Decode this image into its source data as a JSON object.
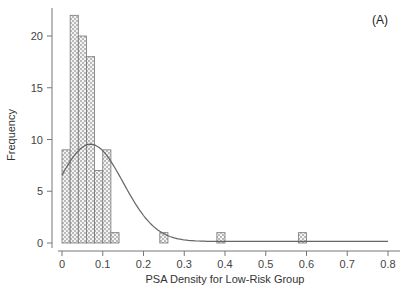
{
  "chart_data": {
    "type": "bar",
    "subtype": "histogram_with_normal_curve",
    "panel_label": "(A)",
    "title": "",
    "xlabel": "PSA Density for Low-Risk Group",
    "ylabel": "Frequency",
    "xlim": [
      0,
      0.8
    ],
    "ylim": [
      0,
      22
    ],
    "xticks": [
      0,
      0.1,
      0.2,
      0.3,
      0.4,
      0.5,
      0.6,
      0.7,
      0.8
    ],
    "xtick_labels": [
      "0",
      "0.1",
      "0.2",
      "0.3",
      "0.4",
      "0.5",
      "0.6",
      "0.7",
      "0.8"
    ],
    "yticks": [
      0,
      5,
      10,
      15,
      20
    ],
    "ytick_labels": [
      "0",
      "5",
      "10",
      "15",
      "20"
    ],
    "grid": false,
    "legend": null,
    "bin_width": 0.02,
    "bins": [
      {
        "start": 0.0,
        "end": 0.02,
        "count": 9
      },
      {
        "start": 0.02,
        "end": 0.04,
        "count": 22
      },
      {
        "start": 0.04,
        "end": 0.06,
        "count": 20
      },
      {
        "start": 0.06,
        "end": 0.08,
        "count": 18
      },
      {
        "start": 0.08,
        "end": 0.1,
        "count": 7
      },
      {
        "start": 0.1,
        "end": 0.12,
        "count": 9
      },
      {
        "start": 0.12,
        "end": 0.14,
        "count": 1
      },
      {
        "start": 0.24,
        "end": 0.26,
        "count": 1
      },
      {
        "start": 0.38,
        "end": 0.4,
        "count": 1
      },
      {
        "start": 0.58,
        "end": 0.6,
        "count": 1
      }
    ],
    "normal_curve": {
      "mean": 0.07,
      "sd": 0.08,
      "peak_frequency": 9.4,
      "x_range": [
        0,
        0.8
      ]
    },
    "colors": {
      "bar_fill_pattern": "dotted",
      "bar_stroke": "#777777",
      "curve": "#666666",
      "axis": "#777777"
    }
  }
}
